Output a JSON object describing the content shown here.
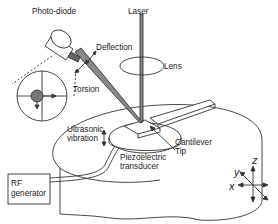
{
  "diagram": {
    "labels": {
      "photodiode": "Photo-diode",
      "laser": "Laser",
      "lens": "Lens",
      "deflection": "Deflection",
      "torsion": "Torsion",
      "ultrasonic_1": "Ultrasonic",
      "ultrasonic_2": "vibration",
      "piezo_1": "Piezoelectric",
      "piezo_2": "transducer",
      "cantilever": "Cantilever",
      "tip": "Tip",
      "rf_1": "RF",
      "rf_2": "generator"
    },
    "axes": {
      "x": "x",
      "y": "y",
      "z": "z"
    },
    "colors": {
      "line": "#333333",
      "beam_fill": "#888888",
      "spot_fill": "#777777",
      "background": "#ffffff"
    }
  }
}
